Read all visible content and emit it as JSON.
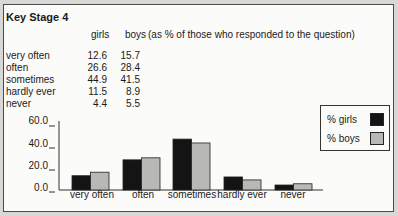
{
  "title": "Key Stage 4",
  "table": {
    "columns": [
      "girls",
      "boys"
    ],
    "note": "(as % of those who responded to the question)",
    "rows": [
      {
        "label": "very often",
        "girls": "12.6",
        "boys": "15.7"
      },
      {
        "label": "often",
        "girls": "26.6",
        "boys": "28.4"
      },
      {
        "label": "sometimes",
        "girls": "44.9",
        "boys": "41.5"
      },
      {
        "label": "hardly ever",
        "girls": "11.5",
        "boys": "8.9"
      },
      {
        "label": "never",
        "girls": "4.4",
        "boys": "5.5"
      }
    ]
  },
  "legend": {
    "girls": "% girls",
    "boys": "% boys"
  },
  "colors": {
    "girls": "#141414",
    "boys": "#b8b8b6",
    "frame": "#4a4a4a",
    "background": "#fbfbf9"
  },
  "y_ticks": [
    "60.0",
    "40.0",
    "20.0",
    "0.0"
  ],
  "chart_data": {
    "type": "bar",
    "title": "Key Stage 4",
    "subtitle": "(as % of those who responded to the question)",
    "categories": [
      "very often",
      "often",
      "sometimes",
      "hardly ever",
      "never"
    ],
    "series": [
      {
        "name": "% girls",
        "values": [
          12.6,
          26.6,
          44.9,
          11.5,
          4.4
        ]
      },
      {
        "name": "% boys",
        "values": [
          15.7,
          28.4,
          41.5,
          8.9,
          5.5
        ]
      }
    ],
    "xlabel": "",
    "ylabel": "",
    "ylim": [
      0,
      60
    ],
    "yticks": [
      0,
      20,
      40,
      60
    ],
    "grid": false,
    "legend_position": "upper right"
  }
}
